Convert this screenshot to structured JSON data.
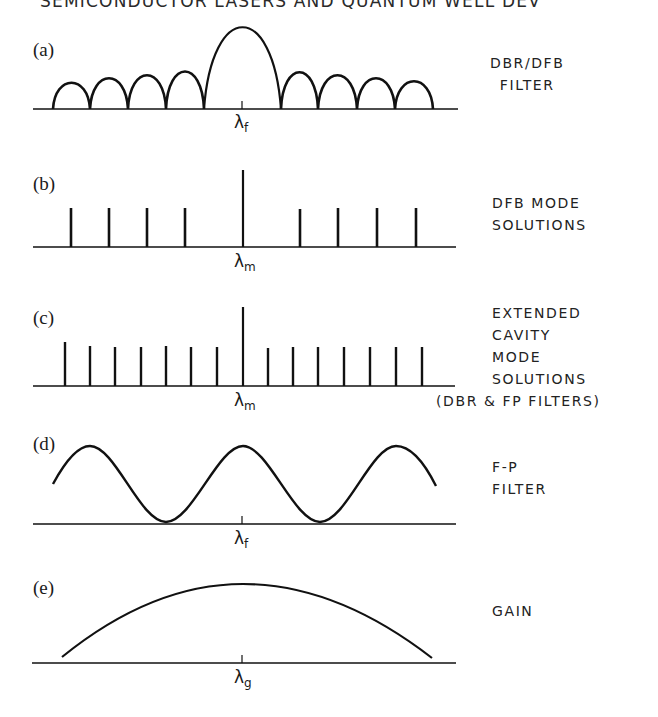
{
  "running_head": "SEMICONDUCTOR LASERS AND QUANTUM WELL DEV",
  "panels": [
    {
      "id": "a",
      "label": "(a)",
      "title": "DBR/DFB\nFILTER",
      "axis_marker": "λ",
      "axis_subscript": "f",
      "curve": "sinc-like filter response: tall central lobe with 4 smaller side lobes on each side"
    },
    {
      "id": "b",
      "label": "(b)",
      "title": "DFB MODE\nSOLUTIONS",
      "axis_marker": "λ",
      "axis_subscript": "m",
      "curve": "discrete mode lines: 4 short lines each side of one tall central line, gap around center"
    },
    {
      "id": "c",
      "label": "(c)",
      "title": "EXTENDED\nCAVITY\nMODE\nSOLUTIONS\n(DBR & FP FILTERS)",
      "axis_marker": "λ",
      "axis_subscript": "m",
      "curve": "dense evenly spaced mode lines: 7 short each side of one tall central line"
    },
    {
      "id": "d",
      "label": "(d)",
      "title": "F-P\nFILTER",
      "axis_marker": "λ",
      "axis_subscript": "f",
      "curve": "periodic sinusoidal transmission with peaks at center and ±period"
    },
    {
      "id": "e",
      "label": "(e)",
      "title": "GAIN",
      "axis_marker": "λ",
      "axis_subscript": "g",
      "curve": "broad parabolic gain curve peaked at center"
    }
  ],
  "colors": {
    "ink": "#111111",
    "background": "#ffffff"
  }
}
